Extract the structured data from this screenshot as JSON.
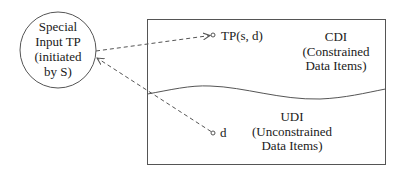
{
  "diagram": {
    "process": {
      "lines": [
        "Special",
        "Input TP",
        "(initiated",
        "by S)"
      ]
    },
    "cdi": {
      "title": "CDI",
      "lines": [
        "(Constrained",
        "Data Items)"
      ]
    },
    "udi": {
      "title": "UDI",
      "lines": [
        "(Unconstrained",
        "Data Items)"
      ]
    },
    "tp_label": "TP(s, d)",
    "d_label": "d",
    "colors": {
      "stroke": "#555555",
      "text": "#1a1a1a",
      "background": "#ffffff"
    }
  }
}
